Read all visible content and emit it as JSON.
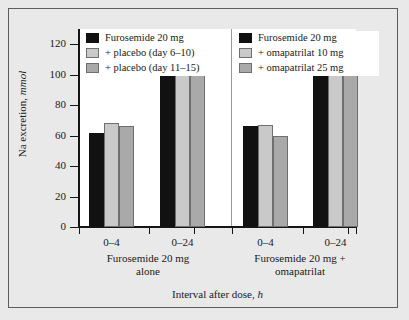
{
  "chart_data": {
    "type": "bar",
    "title": "",
    "xlabel": "Interval after dose, h",
    "ylabel": "Na excretion, mmol",
    "ylabel_plain": "Na excretion,",
    "ylabel_italic": "mmol",
    "xlabel_plain": "Interval after dose,",
    "xlabel_italic": "h",
    "ylim": [
      0,
      130
    ],
    "yticks": [
      0,
      20,
      40,
      60,
      80,
      100,
      120
    ],
    "ytick_labels": [
      "0",
      "20",
      "40",
      "60",
      "80",
      "100",
      "120"
    ],
    "grid": false,
    "legend_position": "top-inside",
    "categories": [
      "0–4",
      "0–24"
    ],
    "panels": [
      {
        "name": "furosemide-alone",
        "label_line1": "Furosemide 20 mg",
        "label_line2": "alone",
        "categories": [
          "0–4",
          "0–24"
        ],
        "series": [
          {
            "name": "Furosemide 20 mg",
            "color": "#111111",
            "style": "black",
            "values": [
              62,
              101
            ]
          },
          {
            "name": "+ placebo (day 6–10)",
            "color": "#c9c9c9",
            "style": "light",
            "values": [
              68,
              107
            ]
          },
          {
            "name": "+ placebo (day 11–15)",
            "color": "#a9a9a9",
            "style": "mid",
            "values": [
              66,
              113
            ]
          }
        ]
      },
      {
        "name": "furosemide-plus-omapatrilat",
        "label_line1": "Furosemide 20 mg +",
        "label_line2": "omapatrilat",
        "categories": [
          "0–4",
          "0–24"
        ],
        "series": [
          {
            "name": "Furosemide 20 mg",
            "color": "#111111",
            "style": "black",
            "values": [
              66,
              107
            ]
          },
          {
            "name": "+ omapatrilat 10 mg",
            "color": "#c9c9c9",
            "style": "light",
            "values": [
              67,
              115
            ]
          },
          {
            "name": "+ omapatrilat 25 mg",
            "color": "#a9a9a9",
            "style": "mid",
            "values": [
              60,
              108
            ]
          }
        ]
      }
    ]
  },
  "legends": {
    "left": [
      {
        "swatch": "black",
        "label": "Furosemide 20 mg"
      },
      {
        "swatch": "light",
        "label": "+ placebo (day 6–10)"
      },
      {
        "swatch": "mid",
        "label": "+ placebo (day 11–15)"
      }
    ],
    "right": [
      {
        "swatch": "black",
        "label": "Furosemide 20 mg"
      },
      {
        "swatch": "light",
        "label": "+ omapatrilat 10 mg"
      },
      {
        "swatch": "mid",
        "label": "+ omapatrilat 25 mg"
      }
    ]
  },
  "axis": {
    "y_ticks": [
      "120",
      "100",
      "80",
      "60",
      "40",
      "20",
      "0"
    ],
    "x_categories_left": [
      "0–4",
      "0–24"
    ],
    "x_categories_right": [
      "0–4",
      "0–24"
    ]
  },
  "colors": {
    "page_background": "#e9e9e9",
    "plot_background": "#ffffff",
    "frame_border": "#5d5d5d",
    "axis": "#151515",
    "series_black": "#111111",
    "series_light_gray": "#c9c9c9",
    "series_mid_gray": "#a9a9a9",
    "divider": "#9a9a9a"
  }
}
